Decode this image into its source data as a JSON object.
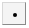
{
  "button": {
    "icon": "dot-icon",
    "colors": {
      "face": "#f4f4f4",
      "border_light": "#d8d8d8",
      "border_dark": "#8a8a8a",
      "dot": "#000000"
    }
  }
}
